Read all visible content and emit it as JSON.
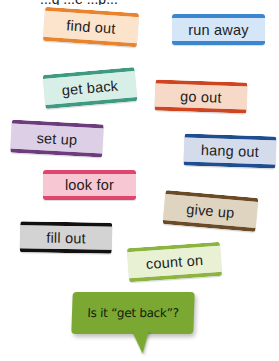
{
  "header": {
    "cut_off_text": "...g ...e ...p..."
  },
  "tags": [
    {
      "label": "find out",
      "color": "#e8832e",
      "fill": "#fbe3cc",
      "left": 44,
      "top": 10,
      "width": 94,
      "height": 34,
      "rotate": 4
    },
    {
      "label": "run away",
      "color": "#3b86cf",
      "fill": "#d4e6f7",
      "left": 172,
      "top": 14,
      "width": 93,
      "height": 31,
      "rotate": 0
    },
    {
      "label": "get back",
      "color": "#3e9a80",
      "fill": "#d7efe7",
      "left": 44,
      "top": 71,
      "width": 92,
      "height": 34,
      "rotate": -5
    },
    {
      "label": "go out",
      "color": "#cf4421",
      "fill": "#f6dac7",
      "left": 155,
      "top": 81,
      "width": 92,
      "height": 31,
      "rotate": 2
    },
    {
      "label": "set up",
      "color": "#6c3c7c",
      "fill": "#ddd0e6",
      "left": 11,
      "top": 122,
      "width": 92,
      "height": 33,
      "rotate": 3
    },
    {
      "label": "hang out",
      "color": "#1f4e90",
      "fill": "#d4dcec",
      "left": 184,
      "top": 135,
      "width": 92,
      "height": 32,
      "rotate": 2
    },
    {
      "label": "look for",
      "color": "#e0456e",
      "fill": "#f7c8d4",
      "left": 43,
      "top": 170,
      "width": 93,
      "height": 30,
      "rotate": 0
    },
    {
      "label": "give up",
      "color": "#6b4a28",
      "fill": "#ded4c0",
      "left": 164,
      "top": 194,
      "width": 93,
      "height": 34,
      "rotate": 5
    },
    {
      "label": "fill out",
      "color": "#111111",
      "fill": "#d3d3d3",
      "left": 20,
      "top": 222,
      "width": 92,
      "height": 31,
      "rotate": 1
    },
    {
      "label": "count on",
      "color": "#8db43e",
      "fill": "#e9f1d5",
      "left": 128,
      "top": 245,
      "width": 93,
      "height": 34,
      "rotate": -4
    }
  ],
  "bubble": {
    "text": "Is it “get back”?",
    "color": "#7aa833"
  }
}
